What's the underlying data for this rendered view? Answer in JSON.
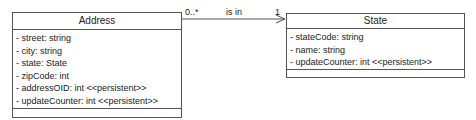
{
  "diagram": {
    "type": "UML class diagram",
    "classes": [
      {
        "name": "Address",
        "attributes": [
          "- street: string",
          "- city: string",
          "- state: State",
          "- zipCode: int",
          "- addressOID: int <<persistent>>",
          "- updateCounter: int <<persistent>>"
        ],
        "operations": []
      },
      {
        "name": "State",
        "attributes": [
          "- stateCode: string",
          "- name: string",
          "- updateCounter: int <<persistent>>"
        ],
        "operations": []
      }
    ],
    "association": {
      "from": "Address",
      "to": "State",
      "label": "is in",
      "source_multiplicity": "0..*",
      "target_multiplicity": "1",
      "navigable_to": "State"
    },
    "colors": {
      "line": "#555555",
      "text": "#222222",
      "background": "#ffffff"
    }
  }
}
